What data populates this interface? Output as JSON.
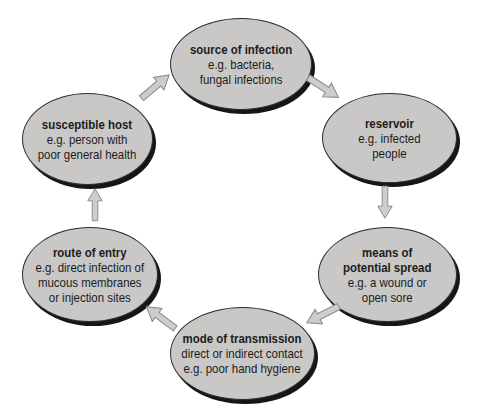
{
  "colors": {
    "background": "#ffffff",
    "ellipse_fill": "#c9c8c6",
    "ellipse_outline": "#2e2e2c",
    "ellipse_shadow": "#161616",
    "arrow_fill": "#cdcdca",
    "arrow_outline": "#8c8c8a",
    "text": "#1c1c1c"
  },
  "diagram": {
    "type": "cycle",
    "nodes": [
      {
        "id": "source-of-infection",
        "title": "source of infection",
        "lines": [
          "e.g. bacteria,",
          "fungal infections"
        ]
      },
      {
        "id": "reservoir",
        "title": "reservoir",
        "lines": [
          "e.g. infected",
          "people"
        ]
      },
      {
        "id": "means-of-potential-spread",
        "title": "means of",
        "title2": "potential spread",
        "lines": [
          "e.g. a wound or",
          "open sore"
        ]
      },
      {
        "id": "mode-of-transmission",
        "title": "mode of transmission",
        "lines": [
          "direct or indirect contact",
          "e.g. poor hand hygiene"
        ]
      },
      {
        "id": "route-of-entry",
        "title": "route of entry",
        "lines": [
          "e.g. direct infection of",
          "mucous membranes",
          "or injection sites"
        ]
      },
      {
        "id": "susceptible-host",
        "title": "susceptible host",
        "lines": [
          "e.g. person with",
          "poor general health"
        ]
      }
    ],
    "edges": [
      {
        "from": "susceptible-host",
        "to": "source-of-infection"
      },
      {
        "from": "source-of-infection",
        "to": "reservoir"
      },
      {
        "from": "reservoir",
        "to": "means-of-potential-spread"
      },
      {
        "from": "means-of-potential-spread",
        "to": "mode-of-transmission"
      },
      {
        "from": "mode-of-transmission",
        "to": "route-of-entry"
      },
      {
        "from": "route-of-entry",
        "to": "susceptible-host"
      }
    ]
  }
}
